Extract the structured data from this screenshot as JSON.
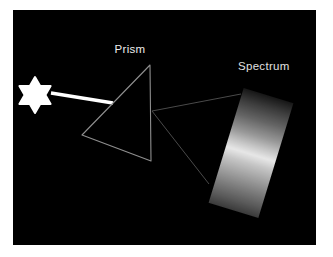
{
  "diagram": {
    "labels": {
      "prism": "Prism",
      "spectrum": "Spectrum"
    },
    "colors": {
      "page_background": "#ffffff",
      "canvas_background": "#000000",
      "star_fill": "#ffffff",
      "beam_stroke": "#ffffff",
      "prism_outline": "#8f8f8f",
      "ray_stroke": "#4a4a4a",
      "prism_label": "#ececec",
      "spectrum_label": "#e0e0e0"
    },
    "geometry": {
      "star_points": "35,77 40.2,86 50.6,86 45.4,95 50.6,104 40.2,104 35,113 29.8,104 19.4,104 24.6,95 19.4,86 29.8,86",
      "beam": {
        "x1": 51,
        "y1": 93,
        "x2": 113,
        "y2": 103
      },
      "prism_vertices": "150,65 82,135 151,161",
      "rays": [
        {
          "x1": 152,
          "y1": 111,
          "x2": 241,
          "y2": 94
        },
        {
          "x1": 152,
          "y1": 111,
          "x2": 209,
          "y2": 184
        }
      ],
      "spectrum_rect": {
        "left": 225,
        "top": 93,
        "width": 52,
        "height": 120,
        "rotation_deg": 17
      }
    },
    "spectrum_gradient_stops": [
      [
        "#161616",
        0
      ],
      [
        "#3c3c3c",
        10
      ],
      [
        "#646464",
        22
      ],
      [
        "#989898",
        35
      ],
      [
        "#c6c6c6",
        44
      ],
      [
        "#e7e7e7",
        51
      ],
      [
        "#c4c4c4",
        59
      ],
      [
        "#a2a2a2",
        69
      ],
      [
        "#7a7a7a",
        81
      ],
      [
        "#5a5a5a",
        91
      ],
      [
        "#3a3a3a",
        100
      ]
    ]
  }
}
